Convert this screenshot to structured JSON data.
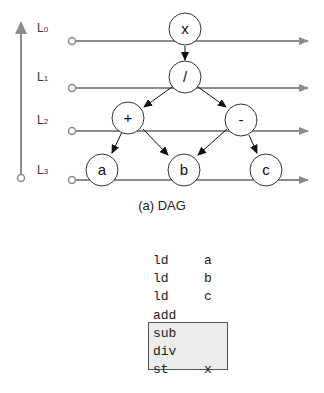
{
  "levels": [
    {
      "label": "L",
      "sub": "0"
    },
    {
      "label": "L",
      "sub": "1"
    },
    {
      "label": "L",
      "sub": "2"
    },
    {
      "label": "L",
      "sub": "3"
    }
  ],
  "nodes": {
    "x": "x",
    "div": "/",
    "add": "+",
    "sub": "-",
    "a": "a",
    "b": "b",
    "c": "c"
  },
  "caption": "(a) DAG",
  "code": [
    {
      "op": "ld",
      "arg": "a"
    },
    {
      "op": "ld",
      "arg": "b"
    },
    {
      "op": "ld",
      "arg": "c"
    },
    {
      "op": "add",
      "arg": ""
    },
    {
      "op": "sub",
      "arg": ""
    },
    {
      "op": "div",
      "arg": ""
    },
    {
      "op": "st",
      "arg": "x"
    }
  ],
  "colors": {
    "line": "#8c8c8c",
    "node_stroke": "#333333",
    "highlight": "#ececec"
  }
}
